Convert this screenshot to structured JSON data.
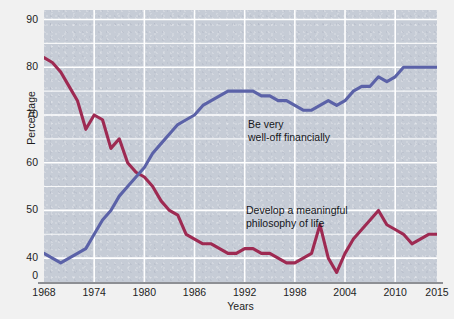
{
  "chart_data": {
    "type": "line",
    "title": "",
    "subtitle": "",
    "xlabel": "Years",
    "ylabel": "Percentage",
    "grid": true,
    "legend_position": "inline-annotations",
    "xlim": [
      1968,
      2015
    ],
    "ylim": [
      35,
      92
    ],
    "y_axis_break": true,
    "y_zero_tick_label": "0",
    "ytick_labels": [
      "0",
      "40",
      "50",
      "60",
      "70",
      "80",
      "90"
    ],
    "ytick_values": [
      36.2,
      40,
      50,
      60,
      70,
      80,
      90
    ],
    "gridline_values": [
      40,
      45,
      50,
      55,
      60,
      65,
      70,
      75,
      80,
      85,
      90
    ],
    "major_gridline_values": [
      40,
      50,
      60,
      70,
      80,
      90
    ],
    "xtick_labels": [
      "1968",
      "1974",
      "1980",
      "1986",
      "1992",
      "1998",
      "2004",
      "2010",
      "2015"
    ],
    "xtick_values": [
      1968,
      1974,
      1980,
      1986,
      1992,
      1998,
      2004,
      2010,
      2015
    ],
    "x_gridline_values": [
      1974,
      1980,
      1986,
      1992,
      1998,
      2004,
      2010
    ],
    "colors": {
      "plot_background": "#c6ccd6",
      "figure_background": "#f1f1f1",
      "gridline": "#ffffff",
      "axis": "#8d8f94",
      "series_philosophy": "#9e2a52",
      "series_financial": "#5b62a8",
      "text": "#1d1d1d"
    },
    "series": [
      {
        "name": "Develop a meaningful philosophy of life",
        "color": "#9e2a52",
        "annotation_lines": [
          "Develop a meaningful",
          "philosophy of life"
        ],
        "x": [
          1968,
          1969,
          1970,
          1971,
          1972,
          1973,
          1974,
          1975,
          1976,
          1977,
          1978,
          1979,
          1980,
          1981,
          1982,
          1983,
          1984,
          1985,
          1986,
          1987,
          1988,
          1989,
          1990,
          1991,
          1992,
          1993,
          1994,
          1995,
          1996,
          1997,
          1998,
          1999,
          2000,
          2001,
          2002,
          2003,
          2004,
          2005,
          2006,
          2007,
          2008,
          2009,
          2010,
          2011,
          2012,
          2013,
          2014,
          2015
        ],
        "values": [
          82,
          81,
          79,
          76,
          73,
          67,
          70,
          69,
          63,
          65,
          60,
          58,
          57,
          55,
          52,
          50,
          49,
          45,
          44,
          43,
          43,
          42,
          41,
          41,
          42,
          42,
          41,
          41,
          40,
          39,
          39,
          40,
          41,
          47,
          40,
          37,
          41,
          44,
          46,
          48,
          50,
          47,
          46,
          45,
          43,
          44,
          45,
          45
        ]
      },
      {
        "name": "Be very well-off financially",
        "color": "#5b62a8",
        "annotation_lines": [
          "Be very",
          "well-off financially"
        ],
        "x": [
          1968,
          1969,
          1970,
          1971,
          1972,
          1973,
          1974,
          1975,
          1976,
          1977,
          1978,
          1979,
          1980,
          1981,
          1982,
          1983,
          1984,
          1985,
          1986,
          1987,
          1988,
          1989,
          1990,
          1991,
          1992,
          1993,
          1994,
          1995,
          1996,
          1997,
          1998,
          1999,
          2000,
          2001,
          2002,
          2003,
          2004,
          2005,
          2006,
          2007,
          2008,
          2009,
          2010,
          2011,
          2012,
          2013,
          2014,
          2015
        ],
        "values": [
          41,
          40,
          39,
          40,
          41,
          42,
          45,
          48,
          50,
          53,
          55,
          57,
          59,
          62,
          64,
          66,
          68,
          69,
          70,
          72,
          73,
          74,
          75,
          75,
          75,
          75,
          74,
          74,
          73,
          73,
          72,
          71,
          71,
          72,
          73,
          72,
          73,
          75,
          76,
          76,
          78,
          77,
          78,
          80,
          80,
          80,
          80,
          80
        ]
      }
    ],
    "annotations": [
      {
        "id": "blue",
        "lines": [
          "Be very",
          "well-off financially"
        ],
        "series": "Be very well-off financially"
      },
      {
        "id": "red",
        "lines": [
          "Develop a meaningful",
          "philosophy of life"
        ],
        "series": "Develop a meaningful philosophy of life"
      }
    ]
  }
}
